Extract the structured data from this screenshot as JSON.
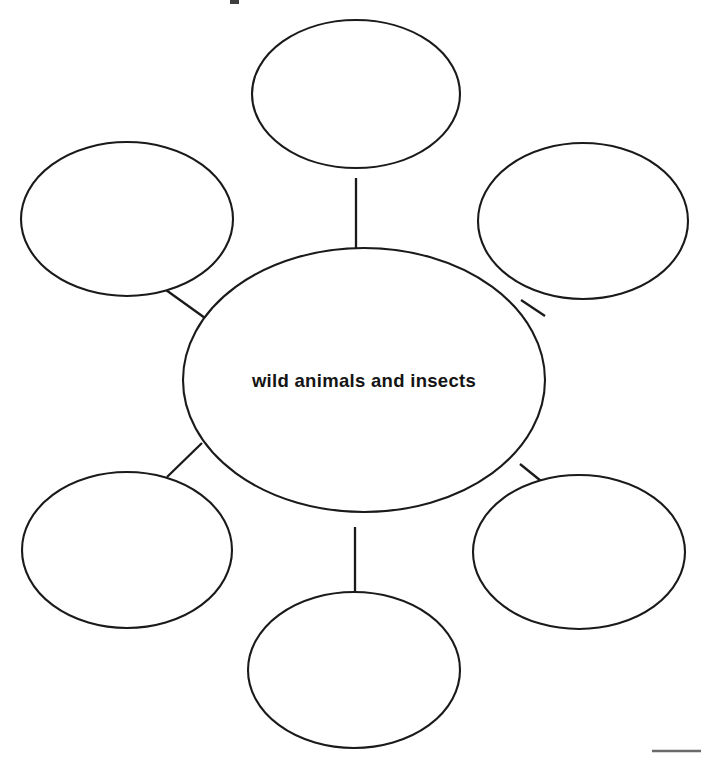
{
  "page": {
    "background_color": "#ffffff",
    "ink_color": "#1a1a1a",
    "width": 703,
    "height": 762
  },
  "diagram": {
    "type": "word-web",
    "center": {
      "label": "wild animals and insects",
      "cx": 364,
      "cy": 380,
      "rx": 181,
      "ry": 132
    },
    "bubbles": [
      {
        "position": "top",
        "label": "",
        "cx": 356,
        "cy": 94,
        "rx": 104,
        "ry": 74
      },
      {
        "position": "upper-left",
        "label": "",
        "cx": 127,
        "cy": 219,
        "rx": 106,
        "ry": 77
      },
      {
        "position": "upper-right",
        "label": "",
        "cx": 583,
        "cy": 221,
        "rx": 105,
        "ry": 78
      },
      {
        "position": "lower-left",
        "label": "",
        "cx": 127,
        "cy": 550,
        "rx": 105,
        "ry": 78
      },
      {
        "position": "lower-right",
        "label": "",
        "cx": 579,
        "cy": 552,
        "rx": 106,
        "ry": 77
      },
      {
        "position": "bottom",
        "label": "",
        "cx": 354,
        "cy": 670,
        "rx": 106,
        "ry": 78
      }
    ],
    "connectors": [
      {
        "from": "center",
        "to": "top",
        "x1": 356,
        "y1": 248,
        "x2": 356,
        "y2": 178
      },
      {
        "from": "center",
        "to": "upper-left",
        "x1": 205,
        "y1": 318,
        "x2": 166,
        "y2": 290
      },
      {
        "from": "center",
        "to": "upper-right",
        "x1": 521,
        "y1": 300,
        "x2": 545,
        "y2": 316
      },
      {
        "from": "center",
        "to": "lower-left",
        "x1": 202,
        "y1": 443,
        "x2": 167,
        "y2": 477
      },
      {
        "from": "center",
        "to": "lower-right",
        "x1": 520,
        "y1": 464,
        "x2": 541,
        "y2": 481
      },
      {
        "from": "center",
        "to": "bottom",
        "x1": 355,
        "y1": 527,
        "x2": 355,
        "y2": 592
      }
    ]
  },
  "marks": {
    "bottom_rule": {
      "x1": 652,
      "y1": 751,
      "x2": 701,
      "y2": 751
    },
    "top_clip_fragment": {
      "x": 230,
      "y": 0,
      "width": 9,
      "height": 4
    }
  }
}
